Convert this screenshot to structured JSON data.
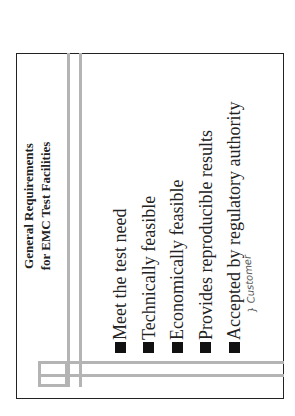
{
  "slide": {
    "title_line1": "General Requirements",
    "title_line2": "for EMC Test Facilities",
    "bullets": [
      "Meet the test need",
      "Technically feasible",
      "Economically feasible",
      "Provides reproducible results",
      "Accepted by regulatory authority"
    ],
    "handwritten_note": "} Customer",
    "bullet_icon": "black-square"
  },
  "colors": {
    "accent_lines": "#b4b4b4",
    "text": "#222222",
    "border": "#222222"
  }
}
